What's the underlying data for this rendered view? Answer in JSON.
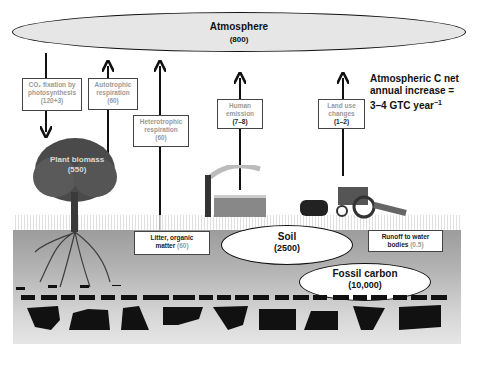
{
  "atmosphere": {
    "label": "Atmosphere",
    "value": "(800)"
  },
  "fluxes": {
    "co2_fixation": {
      "label_line1": "CO₂ fixation by",
      "label_line2": "photosynthesis",
      "value": "(120+3)"
    },
    "autotrophic": {
      "label_line1": "Autotrophic",
      "label_line2": "respiration",
      "value": "(60)"
    },
    "heterotrophic": {
      "label_line1": "Heterotrophic",
      "label_line2": "respiration",
      "value": "(60)"
    },
    "human_emission": {
      "label_line1": "Human",
      "label_line2": "emission",
      "value": "(7–8)"
    },
    "land_use": {
      "label_line1": "Land use",
      "label_line2": "changes",
      "value": "(1–2)"
    },
    "litter": {
      "label_line1": "Litter, organic",
      "label_line2": "matter",
      "value": "(60)"
    },
    "runoff": {
      "label_line1": "Runoff to water",
      "label_line2": "bodies",
      "value": "(0.5)"
    }
  },
  "pools": {
    "plant_biomass": {
      "label": "Plant biomass",
      "value": "(550)"
    },
    "soil": {
      "label": "Soil",
      "value": "(2500)"
    },
    "fossil": {
      "label": "Fossil carbon",
      "value": "(10,000)"
    }
  },
  "note": {
    "line1": "Atmospheric C net",
    "line2": "annual increase =",
    "line3": "3–4 GTC year",
    "sup": "−1"
  },
  "colors": {
    "ground": "#a8a8a8",
    "fossil": "#111111",
    "oval_fill": "#e8e8e8"
  }
}
